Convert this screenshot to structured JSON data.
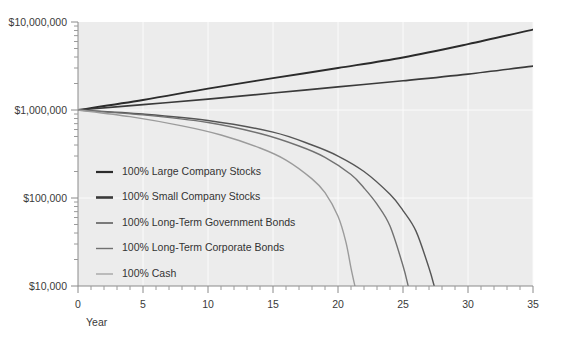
{
  "chart_data": {
    "type": "line",
    "title": "",
    "subtitle": "",
    "xlabel": "Year",
    "ylabel": "",
    "xlim": [
      0,
      35
    ],
    "ylim": [
      10000,
      10000000
    ],
    "yscale": "log",
    "grid": true,
    "legend_position": "inside-left",
    "x_tick_labels": [
      "0",
      "5",
      "10",
      "15",
      "20",
      "25",
      "30",
      "35"
    ],
    "x_ticks": [
      0,
      5,
      10,
      15,
      20,
      25,
      30,
      35
    ],
    "x_minor_tick_step": 1,
    "y_tick_labels": [
      "$10,000,000",
      "$1,000,000",
      "$100,000",
      "$10,000"
    ],
    "y_ticks": [
      10000000,
      1000000,
      100000,
      10000
    ],
    "starting_value": 1000000,
    "series": [
      {
        "name": "100% Large Company Stocks",
        "color": "#2b2b2b",
        "width": 1.9,
        "x": [
          0,
          5,
          10,
          15,
          20,
          25,
          30,
          35
        ],
        "values": [
          1000000,
          1300000,
          1750000,
          2300000,
          3000000,
          3950000,
          5600000,
          8200000
        ]
      },
      {
        "name": "100% Small Company Stocks",
        "color": "#3a3a3a",
        "width": 1.7,
        "x": [
          0,
          5,
          10,
          15,
          20,
          25,
          30,
          35
        ],
        "values": [
          1000000,
          1150000,
          1330000,
          1560000,
          1830000,
          2150000,
          2560000,
          3150000
        ]
      },
      {
        "name": "100% Long-Term Government Bonds",
        "color": "#555555",
        "width": 1.4,
        "x": [
          0,
          5,
          10,
          15,
          18,
          20,
          22,
          24,
          25,
          26,
          27,
          27.4
        ],
        "values": [
          1000000,
          900000,
          760000,
          560000,
          400000,
          300000,
          200000,
          110000,
          72000,
          42000,
          16000,
          10000
        ]
      },
      {
        "name": "100% Long-Term Corporate Bonds",
        "color": "#717171",
        "width": 1.4,
        "x": [
          0,
          5,
          10,
          14,
          17,
          19,
          21,
          22,
          23,
          24,
          25,
          25.4
        ],
        "values": [
          1000000,
          880000,
          720000,
          540000,
          390000,
          290000,
          185000,
          130000,
          85000,
          48000,
          17000,
          10000
        ]
      },
      {
        "name": "100% Cash",
        "color": "#9b9b9b",
        "width": 1.4,
        "x": [
          0,
          4,
          8,
          11,
          14,
          16,
          18,
          19,
          20,
          20.6,
          21,
          21.3
        ],
        "values": [
          1000000,
          840000,
          660000,
          520000,
          370000,
          270000,
          165000,
          115000,
          62000,
          32000,
          16000,
          10000
        ]
      }
    ],
    "legend": [
      {
        "label": "100% Large Company Stocks",
        "color": "#2b2b2b",
        "width": 2.2
      },
      {
        "label": "100% Small Company Stocks",
        "color": "#3a3a3a",
        "width": 2.6
      },
      {
        "label": "100% Long-Term Government Bonds",
        "color": "#555555",
        "width": 1.5
      },
      {
        "label": "100% Long-Term Corporate Bonds",
        "color": "#717171",
        "width": 1.4
      },
      {
        "label": "100% Cash",
        "color": "#9b9b9b",
        "width": 1.2
      }
    ]
  },
  "colors": {
    "plot_background": "#ececec",
    "page_background": "#ffffff",
    "axis": "#8a8a8a",
    "gridline": "#fbfbfb",
    "text": "#333333"
  }
}
